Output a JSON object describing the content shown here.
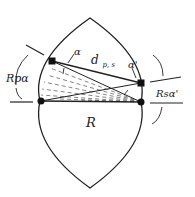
{
  "diagram": {
    "labels": {
      "alpha_left": "α",
      "alpha_right": "α'",
      "distance": "d",
      "distance_subscript": "p, s",
      "rp_alpha": "Rpα",
      "rs_alpha": "Rsα'",
      "radius": "R"
    },
    "colors": {
      "stroke": "#222222",
      "dashed": "#666666",
      "background": "#ffffff"
    }
  }
}
